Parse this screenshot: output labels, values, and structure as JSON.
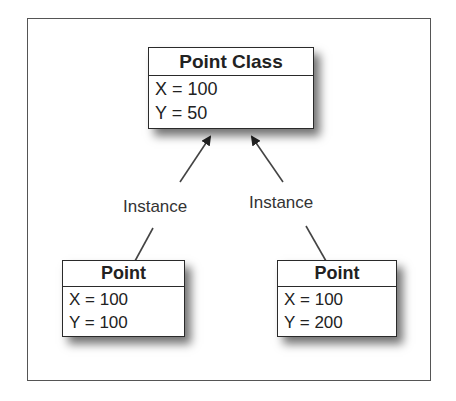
{
  "diagram": {
    "class_box": {
      "title": "Point Class",
      "attributes": [
        "X = 100",
        "Y = 50"
      ]
    },
    "instance_boxes": [
      {
        "title": "Point",
        "attributes": [
          "X = 100",
          "Y = 100"
        ]
      },
      {
        "title": "Point",
        "attributes": [
          "X = 100",
          "Y = 200"
        ]
      }
    ],
    "relations": [
      {
        "label": "Instance",
        "from": "instance_boxes.0",
        "to": "class_box"
      },
      {
        "label": "Instance",
        "from": "instance_boxes.1",
        "to": "class_box"
      }
    ]
  }
}
